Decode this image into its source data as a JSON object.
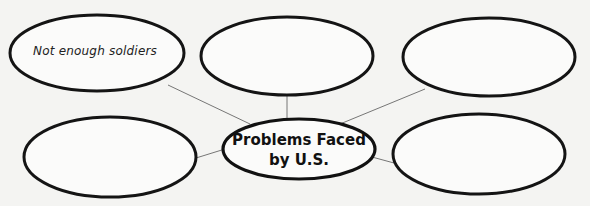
{
  "diagram": {
    "type": "web-organizer",
    "center": {
      "line1": "Problems Faced",
      "line2": "by U.S."
    },
    "nodes": [
      {
        "position": "top-left",
        "text": "Not enough soldiers"
      },
      {
        "position": "top-middle",
        "text": ""
      },
      {
        "position": "top-right",
        "text": ""
      },
      {
        "position": "bottom-left",
        "text": ""
      },
      {
        "position": "bottom-right",
        "text": ""
      }
    ]
  }
}
